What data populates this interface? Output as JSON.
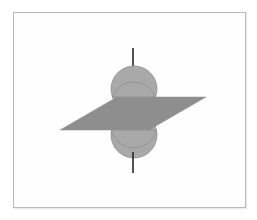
{
  "figure": {
    "title": "Sphere intersected by a plane",
    "background_color": "#ffffff",
    "frame": {
      "name": "figure-frame",
      "x": 13,
      "y": 12,
      "width": 233,
      "height": 196,
      "border_color": "#b9b9b9",
      "fill_color": "#fefefe"
    },
    "colors": {
      "sphere_fill": "#a9a9a9",
      "sphere_stroke": "#8f8f8f",
      "plane_fill": "#8e8e8e",
      "plane_stroke": "#8e8e8e",
      "axis_color": "#262626"
    }
  },
  "chart_data": {
    "type": "diagram",
    "title": "Sphere intersected by a plane",
    "elements": [
      {
        "name": "upper-sphere-cap",
        "shape": "circle",
        "cx": 134,
        "cy": 89,
        "r": 23,
        "fill": "#a9a9a9",
        "label": "upper hemisphere"
      },
      {
        "name": "lower-sphere-cap",
        "shape": "circle",
        "cx": 134,
        "cy": 135,
        "r": 23,
        "fill": "#a9a9a9",
        "label": "lower hemisphere"
      },
      {
        "name": "cutting-plane",
        "shape": "parallelogram",
        "points": "60,130 117,97 206,97 149,130",
        "fill": "#8e8e8e",
        "label": "cutting plane"
      },
      {
        "name": "axis-line-upper",
        "shape": "line",
        "x1": 133,
        "y1": 48,
        "x2": 133,
        "y2": 70,
        "stroke": "#262626",
        "stroke_width": 1.6,
        "label": "polar axis above sphere"
      },
      {
        "name": "axis-line-lower",
        "shape": "line",
        "x1": 133,
        "y1": 152,
        "x2": 133,
        "y2": 173,
        "stroke": "#262626",
        "stroke_width": 1.6,
        "label": "polar axis below sphere"
      }
    ],
    "xlabel": "",
    "ylabel": "",
    "legend": [],
    "annotations": []
  }
}
